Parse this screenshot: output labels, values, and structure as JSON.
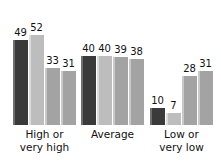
{
  "chart_data": {
    "type": "bar",
    "title": "",
    "subtitle": "",
    "xlabel": "",
    "ylabel": "",
    "ylim": [
      0,
      60
    ],
    "grid": false,
    "legend": "none",
    "orientation": "vertical",
    "categories": [
      "High or\nvery high",
      "Average",
      "Low or\nvery low"
    ],
    "series": [
      {
        "name": "Series 1",
        "color": "#3a3a3a",
        "style": "dark",
        "values": [
          49,
          40,
          10
        ]
      },
      {
        "name": "Series 2",
        "color": "#bdbdbd",
        "style": "light",
        "values": [
          52,
          40,
          7
        ]
      },
      {
        "name": "Series 3",
        "color": "#a3a3a3",
        "style": "medium",
        "values": [
          33,
          39,
          28
        ]
      },
      {
        "name": "Series 4",
        "color": "#a3a3a3",
        "style": "medium",
        "values": [
          31,
          38,
          31
        ]
      }
    ],
    "groups": [
      {
        "label": "High or\nvery high",
        "bars": [
          {
            "value": 49,
            "style": "dark"
          },
          {
            "value": 52,
            "style": "light"
          },
          {
            "value": 33,
            "style": "medium"
          },
          {
            "value": 31,
            "style": "medium"
          }
        ]
      },
      {
        "label": "Average",
        "bars": [
          {
            "value": 40,
            "style": "dark"
          },
          {
            "value": 40,
            "style": "light"
          },
          {
            "value": 39,
            "style": "medium"
          },
          {
            "value": 38,
            "style": "medium"
          }
        ]
      },
      {
        "label": "Low or\nvery low",
        "bars": [
          {
            "value": 10,
            "style": "dark"
          },
          {
            "value": 7,
            "style": "light"
          },
          {
            "value": 28,
            "style": "medium"
          },
          {
            "value": 31,
            "style": "medium"
          }
        ]
      }
    ]
  }
}
